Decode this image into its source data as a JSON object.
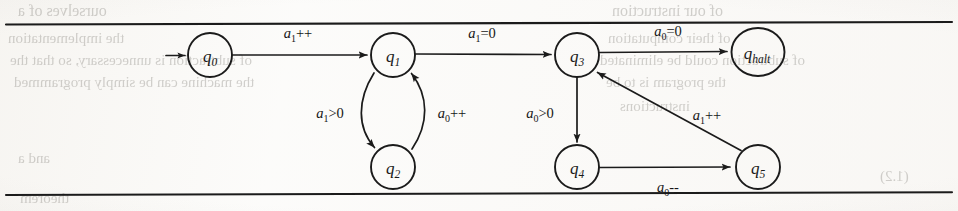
{
  "page": {
    "width": 958,
    "height": 211,
    "background_color": "#fcfcfb",
    "ink_color": "#1b1b1b",
    "kind": "scanned-book-figure"
  },
  "rules": {
    "top_rule_label": "horizontal-rule-top",
    "bottom_rule_label": "horizontal-rule-bottom"
  },
  "ghost_text": {
    "note": "faint bleed-through text from the reverse side of the scanned page",
    "lines": [
      {
        "text": "ourselves of a",
        "x": 18,
        "y": 2,
        "size": 16
      },
      {
        "text": "of our instruction",
        "x": 612,
        "y": 2,
        "size": 16
      },
      {
        "text": "the implementation",
        "x": 8,
        "y": 30,
        "size": 15
      },
      {
        "text": "of their computation",
        "x": 608,
        "y": 30,
        "size": 15
      },
      {
        "text": "of subtraction is unnecessary, so that the",
        "x": 10,
        "y": 52,
        "size": 15
      },
      {
        "text": "of subtraction could be eliminated",
        "x": 600,
        "y": 52,
        "size": 15
      },
      {
        "text": "the machine can be simply programmed",
        "x": 14,
        "y": 74,
        "size": 15
      },
      {
        "text": "the program is to be",
        "x": 606,
        "y": 74,
        "size": 15
      },
      {
        "text": "instructions",
        "x": 620,
        "y": 98,
        "size": 15
      },
      {
        "text": "and a",
        "x": 18,
        "y": 150,
        "size": 15
      },
      {
        "text": "(1.2)",
        "x": 880,
        "y": 168,
        "size": 15
      },
      {
        "text": "theorem",
        "x": 20,
        "y": 190,
        "size": 15
      }
    ]
  },
  "automaton": {
    "title": "state-transition-diagram",
    "start_state": "q0",
    "halt_state": "qhalt",
    "nodes": [
      {
        "id": "q0",
        "label_base": "q",
        "label_sub": "0",
        "cx": 210,
        "cy": 55,
        "rx": 22,
        "ry": 22
      },
      {
        "id": "q1",
        "label_base": "q",
        "label_sub": "1",
        "cx": 393,
        "cy": 55,
        "rx": 22,
        "ry": 22
      },
      {
        "id": "q2",
        "label_base": "q",
        "label_sub": "2",
        "cx": 393,
        "cy": 167,
        "rx": 22,
        "ry": 22
      },
      {
        "id": "q3",
        "label_base": "q",
        "label_sub": "3",
        "cx": 577,
        "cy": 55,
        "rx": 22,
        "ry": 22
      },
      {
        "id": "q4",
        "label_base": "q",
        "label_sub": "4",
        "cx": 577,
        "cy": 167,
        "rx": 22,
        "ry": 22
      },
      {
        "id": "q5",
        "label_base": "q",
        "label_sub": "5",
        "cx": 758,
        "cy": 167,
        "rx": 22,
        "ry": 22
      },
      {
        "id": "qhalt",
        "label_base": "q",
        "label_sub": "halt",
        "cx": 758,
        "cy": 52,
        "rx": 26.5,
        "ry": 24
      }
    ],
    "transitions": [
      {
        "id": "start-to-q0",
        "from": "",
        "to": "q0",
        "label_base": "",
        "label_sub": "",
        "label_op": ""
      },
      {
        "id": "q0-to-q1",
        "from": "q0",
        "to": "q1",
        "label_base": "a",
        "label_sub": "1",
        "label_op": "++",
        "label_x": 298,
        "label_y": 38
      },
      {
        "id": "q1-to-q3",
        "from": "q1",
        "to": "q3",
        "label_base": "a",
        "label_sub": "1",
        "label_op": "=0",
        "label_x": 482,
        "label_y": 38
      },
      {
        "id": "q3-to-qhalt",
        "from": "q3",
        "to": "qhalt",
        "label_base": "a",
        "label_sub": "0",
        "label_op": "=0",
        "label_x": 668,
        "label_y": 36
      },
      {
        "id": "q1-to-q2",
        "from": "q1",
        "to": "q2",
        "label_base": "a",
        "label_sub": "1",
        "label_op": ">0",
        "label_x": 330,
        "label_y": 118
      },
      {
        "id": "q2-to-q1",
        "from": "q2",
        "to": "q1",
        "label_base": "a",
        "label_sub": "0",
        "label_op": "++",
        "label_x": 452,
        "label_y": 118
      },
      {
        "id": "q3-to-q4",
        "from": "q3",
        "to": "q4",
        "label_base": "a",
        "label_sub": "0",
        "label_op": ">0",
        "label_x": 540,
        "label_y": 118
      },
      {
        "id": "q4-to-q5",
        "from": "q4",
        "to": "q5",
        "label_base": "a",
        "label_sub": "0",
        "label_op": "--",
        "label_x": 668,
        "label_y": 192
      },
      {
        "id": "q5-to-q3",
        "from": "q5",
        "to": "q3",
        "label_base": "a",
        "label_sub": "1",
        "label_op": "++",
        "label_x": 707,
        "label_y": 120
      }
    ]
  }
}
